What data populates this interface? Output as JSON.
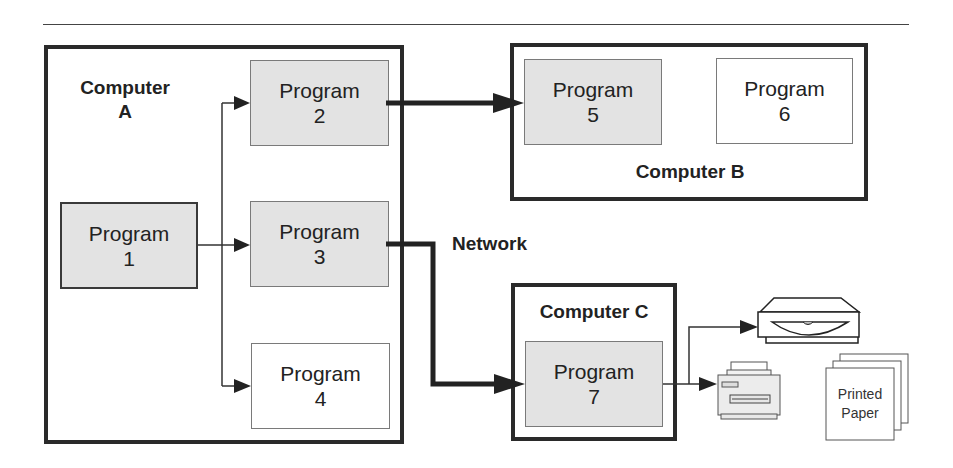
{
  "diagram": {
    "computers": [
      {
        "id": "A",
        "label_line1": "Computer",
        "label_line2": "A"
      },
      {
        "id": "B",
        "label": "Computer B"
      },
      {
        "id": "C",
        "label": "Computer C"
      }
    ],
    "programs": [
      {
        "id": 1,
        "label": "Program",
        "number": "1",
        "computer": "A",
        "style": "shaded"
      },
      {
        "id": 2,
        "label": "Program",
        "number": "2",
        "computer": "A",
        "style": "shaded"
      },
      {
        "id": 3,
        "label": "Program",
        "number": "3",
        "computer": "A",
        "style": "shaded"
      },
      {
        "id": 4,
        "label": "Program",
        "number": "4",
        "computer": "A",
        "style": "plain"
      },
      {
        "id": 5,
        "label": "Program",
        "number": "5",
        "computer": "B",
        "style": "shaded"
      },
      {
        "id": 6,
        "label": "Program",
        "number": "6",
        "computer": "B",
        "style": "plain"
      },
      {
        "id": 7,
        "label": "Program",
        "number": "7",
        "computer": "C",
        "style": "shaded"
      }
    ],
    "network_label": "Network",
    "devices": {
      "scanner": "scanner-icon",
      "printer": "printer-icon",
      "printed_paper": {
        "line1": "Printed",
        "line2": "Paper"
      }
    },
    "edges": [
      {
        "from": "Program 1",
        "to": "Program 2",
        "type": "local"
      },
      {
        "from": "Program 1",
        "to": "Program 3",
        "type": "local"
      },
      {
        "from": "Program 1",
        "to": "Program 4",
        "type": "local"
      },
      {
        "from": "Program 2",
        "to": "Program 5",
        "type": "network"
      },
      {
        "from": "Program 3",
        "to": "Program 7",
        "type": "network"
      },
      {
        "from": "Program 7",
        "to": "Scanner",
        "type": "local"
      },
      {
        "from": "Program 7",
        "to": "Printer",
        "type": "local"
      }
    ],
    "colors": {
      "box_shaded": "#e3e3e3",
      "border_dark": "#2a2a2a",
      "text": "#222222"
    }
  }
}
